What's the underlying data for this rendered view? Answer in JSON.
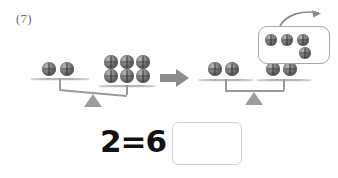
{
  "problem": {
    "number_label": "(7)"
  },
  "colors": {
    "ball_dark": "#5f5f5f",
    "ball_light": "#b9b9b9",
    "scale_gray": "#9a9a9a",
    "pan_gray": "#b5b5b5",
    "box_border": "#a8a8a8",
    "answer_box_border": "#d2d2d2",
    "arrow_gray": "#8c8c8c",
    "text_dark": "#111111",
    "label_gray": "#6d6d6d",
    "page_background": "#ffffff"
  },
  "scales": {
    "left": {
      "name": "unbalanced-scale",
      "state": "tilted-right",
      "left_pan": {
        "ball_count": 2,
        "rows": [
          2
        ]
      },
      "right_pan": {
        "ball_count": 6,
        "rows": [
          3,
          3
        ]
      }
    },
    "right": {
      "name": "balanced-scale",
      "state": "level",
      "left_pan": {
        "ball_count": 2,
        "rows": [
          2
        ]
      },
      "right_pan": {
        "ball_count": 2,
        "rows": [
          2
        ]
      }
    }
  },
  "transition": {
    "arrow_icon": "right-arrow-icon"
  },
  "removed_group": {
    "arrow_icon": "curved-up-right-arrow-icon",
    "ball_count": 4,
    "rows": [
      3,
      1
    ]
  },
  "equation": {
    "left_operand": "2",
    "operator": "=",
    "right_operand": "6",
    "answer_value": "",
    "answer_placeholder": ""
  }
}
